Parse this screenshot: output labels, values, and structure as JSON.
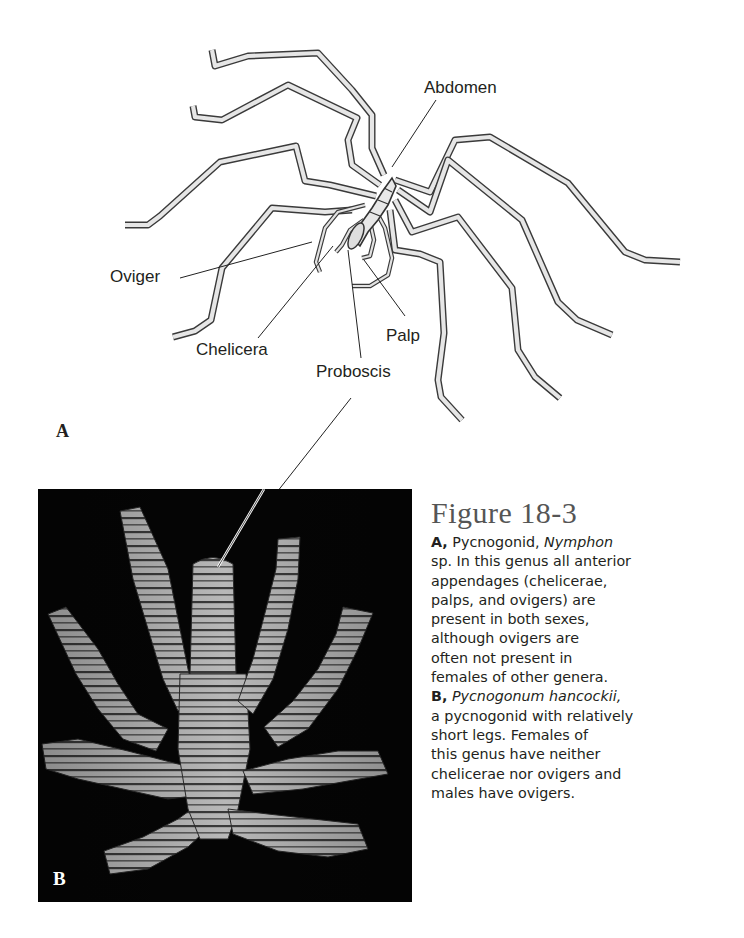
{
  "figure": {
    "number_label": "Figure 18-3",
    "panel_a": {
      "letter": "A",
      "labels": {
        "abdomen": "Abdomen",
        "oviger": "Oviger",
        "chelicera": "Chelicera",
        "palp": "Palp",
        "proboscis": "Proboscis"
      }
    },
    "panel_b": {
      "letter": "B"
    },
    "caption": {
      "lines": [
        {
          "lead": "A,",
          "text": " Pycnogonid, ",
          "italic": "Nymphon"
        },
        {
          "text": "sp. In this genus all anterior"
        },
        {
          "text": "appendages (chelicerae,"
        },
        {
          "text": "palps, and ovigers) are"
        },
        {
          "text": "present in both sexes,"
        },
        {
          "text": "although ovigers are"
        },
        {
          "text": "often not present in"
        },
        {
          "text": "females of other genera."
        },
        {
          "lead": "B,",
          "italic": " Pycnogonum hancockii,"
        },
        {
          "text": "a pycnogonid with relatively"
        },
        {
          "text": "short legs. Females of"
        },
        {
          "text": "this genus have neither"
        },
        {
          "text": "chelicerae nor ovigers and"
        },
        {
          "text": "males have ovigers."
        }
      ]
    }
  }
}
